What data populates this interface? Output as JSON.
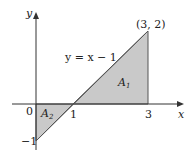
{
  "diagram": {
    "axes": {
      "x_label": "x",
      "y_label": "y"
    },
    "ticks": {
      "origin": "0",
      "x_one": "1",
      "x_three": "3",
      "y_minus_one": "−1"
    },
    "point_label": "(3, 2)",
    "line_label": "y = x − 1",
    "regions": {
      "a1": "A",
      "a1_sub": "1",
      "a2": "A",
      "a2_sub": "2"
    },
    "colors": {
      "fill": "#c8c8c8",
      "line": "#555555",
      "axis": "#333333"
    }
  }
}
